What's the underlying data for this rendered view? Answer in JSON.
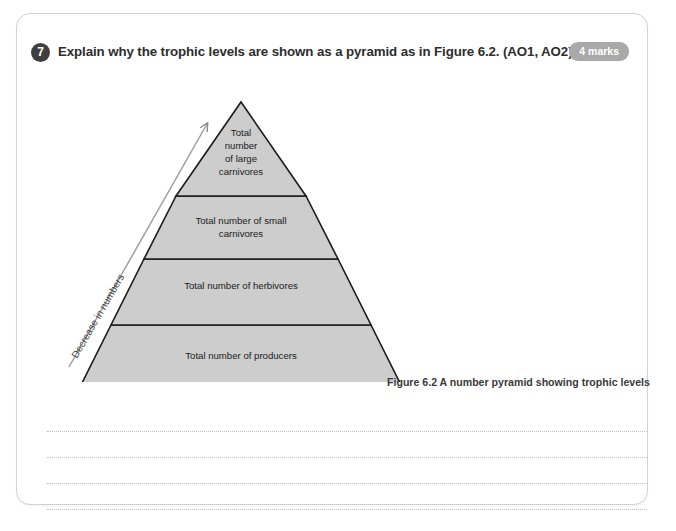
{
  "page": {
    "border_color": "#d3d3d3",
    "background": "#ffffff"
  },
  "question": {
    "number": "7",
    "text": "Explain why the trophic levels are shown as a pyramid as in Figure 6.2. (AO1, AO2)",
    "marks_label": "4 marks",
    "badge_color": "#3f3f3f",
    "marks_badge_color": "#a9a9a9"
  },
  "figure": {
    "caption": "Figure 6.2 A number pyramid showing trophic levels",
    "arrow_label": "Decrease in numbers",
    "fill_color": "#cdcdcd",
    "stroke_color": "#1b1b1b",
    "tiers": [
      {
        "id": "tier-large-carnivores",
        "lines": [
          "Total",
          "number",
          "of large",
          "carnivores"
        ]
      },
      {
        "id": "tier-small-carnivores",
        "lines": [
          "Total number of small",
          "carnivores"
        ]
      },
      {
        "id": "tier-herbivores",
        "lines": [
          "Total number of herbivores"
        ]
      },
      {
        "id": "tier-producers",
        "lines": [
          "Total number of producers"
        ]
      }
    ]
  },
  "answer_area": {
    "line_count": 4
  }
}
